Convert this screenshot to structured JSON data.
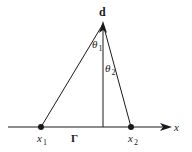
{
  "diagram": {
    "colors": {
      "line": "#1a1a1a",
      "background": "#ffffff"
    },
    "axis": {
      "label": "x"
    },
    "apex": {
      "label": "d"
    },
    "points": [
      {
        "symbol": "x",
        "subscript": "1"
      },
      {
        "symbol": "x",
        "subscript": "2"
      }
    ],
    "angles": [
      {
        "symbol": "θ",
        "subscript": "1"
      },
      {
        "symbol": "θ",
        "subscript": "2"
      }
    ],
    "curve_label": "Γ"
  }
}
